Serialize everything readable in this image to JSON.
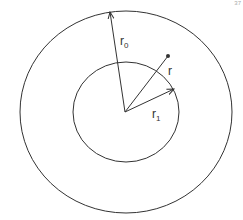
{
  "diagram": {
    "type": "concentric-circles-radii",
    "outer_circle": {
      "cx": 126,
      "cy": 112,
      "rx": 106,
      "ry": 101,
      "label": "r",
      "label_sub": "0"
    },
    "inner_circle": {
      "cx": 126,
      "cy": 112,
      "rx": 53,
      "ry": 50,
      "label": "r",
      "label_sub": "1"
    },
    "point_radius": {
      "label": "r",
      "end": [
        168,
        56
      ]
    },
    "center": [
      125,
      112
    ],
    "stroke_color": "#333333"
  },
  "labels": {
    "r0_main": "r",
    "r0_sub": "0",
    "r_main": "r",
    "r1_main": "r",
    "r1_sub": "1",
    "corner": "37"
  }
}
